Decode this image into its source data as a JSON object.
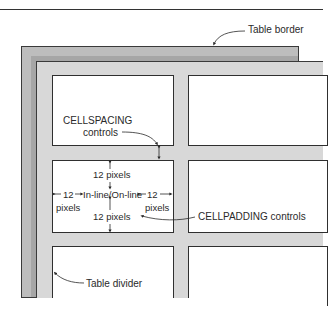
{
  "diagram": {
    "labels": {
      "table_border": "Table border",
      "cellspacing_line1": "CELLSPACING",
      "cellspacing_line2": "controls",
      "padding_top": "12 pixels",
      "padding_bottom": "12 pixels",
      "padding_left_value": "12",
      "padding_left_unit": "pixels",
      "padding_right_value": "12",
      "padding_right_unit": "pixels",
      "cell_content": "In-line/On-line",
      "cellpadding": "CELLPADDING controls",
      "table_divider": "Table divider"
    },
    "colors": {
      "border_light": "#bdbdbd",
      "border_dark": "#999999",
      "spacing_fill": "#d8d8d8",
      "cell_fill": "#ffffff",
      "outline": "#2f2f2f"
    }
  }
}
